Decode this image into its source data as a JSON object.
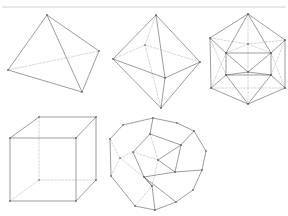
{
  "figure": {
    "background_color": "#ffffff",
    "solid_edge_color": "#5a5a5a",
    "hidden_edge_color": "#b4b4b4",
    "rule_color": "#c9c9c9",
    "canvas": {
      "width": 288,
      "height": 216
    },
    "top_rule": {
      "x1": 2,
      "y1": 7,
      "x2": 286,
      "y2": 7
    }
  },
  "solids": [
    {
      "name": "tetrahedron",
      "label": "Tetrahedron",
      "faces": 4,
      "vertices_count": 4,
      "edges_count": 6,
      "row": 1,
      "column": 1,
      "vertices": [
        [
          47,
          15
        ],
        [
          8,
          70
        ],
        [
          82,
          92
        ],
        [
          99,
          51
        ]
      ],
      "solid_edges": [
        [
          0,
          1
        ],
        [
          0,
          2
        ],
        [
          0,
          3
        ],
        [
          1,
          2
        ],
        [
          2,
          3
        ]
      ],
      "hidden_edges": [
        [
          1,
          3
        ]
      ]
    },
    {
      "name": "octahedron",
      "label": "Octahedron",
      "faces": 8,
      "vertices_count": 6,
      "edges_count": 12,
      "row": 1,
      "column": 2,
      "vertices": [
        [
          156,
          15
        ],
        [
          113,
          59
        ],
        [
          165,
          78
        ],
        [
          200,
          62
        ],
        [
          145,
          45
        ],
        [
          161,
          108
        ]
      ],
      "solid_edges": [
        [
          0,
          1
        ],
        [
          0,
          2
        ],
        [
          0,
          3
        ],
        [
          1,
          2
        ],
        [
          2,
          3
        ],
        [
          1,
          5
        ],
        [
          2,
          5
        ],
        [
          3,
          5
        ]
      ],
      "hidden_edges": [
        [
          0,
          4
        ],
        [
          1,
          4
        ],
        [
          3,
          4
        ],
        [
          4,
          5
        ]
      ]
    },
    {
      "name": "icosahedron",
      "label": "Icosahedron",
      "faces": 20,
      "vertices_count": 12,
      "edges_count": 30,
      "row": 1,
      "column": 3,
      "vertices": [
        [
          248,
          14
        ],
        [
          210,
          38
        ],
        [
          248,
          104
        ],
        [
          211,
          88
        ],
        [
          285,
          88
        ],
        [
          285,
          40
        ],
        [
          226,
          53
        ],
        [
          271,
          53
        ],
        [
          248,
          72
        ],
        [
          226,
          75
        ],
        [
          271,
          75
        ],
        [
          248,
          44
        ]
      ],
      "solid_edges": [
        [
          0,
          1
        ],
        [
          0,
          5
        ],
        [
          1,
          3
        ],
        [
          5,
          4
        ],
        [
          3,
          2
        ],
        [
          4,
          2
        ],
        [
          0,
          6
        ],
        [
          0,
          7
        ],
        [
          1,
          6
        ],
        [
          5,
          7
        ],
        [
          6,
          7
        ],
        [
          6,
          9
        ],
        [
          7,
          10
        ],
        [
          9,
          10
        ],
        [
          6,
          8
        ],
        [
          7,
          8
        ],
        [
          8,
          9
        ],
        [
          8,
          10
        ],
        [
          2,
          9
        ],
        [
          2,
          10
        ],
        [
          3,
          9
        ],
        [
          4,
          10
        ]
      ],
      "hidden_edges": [
        [
          0,
          11
        ],
        [
          1,
          11
        ],
        [
          5,
          11
        ],
        [
          11,
          6
        ],
        [
          11,
          7
        ],
        [
          1,
          9
        ],
        [
          5,
          10
        ],
        [
          3,
          6
        ],
        [
          4,
          7
        ],
        [
          2,
          8
        ],
        [
          11,
          8
        ],
        [
          3,
          4
        ]
      ]
    },
    {
      "name": "cube",
      "label": "Cube",
      "faces": 6,
      "vertices_count": 8,
      "edges_count": 12,
      "row": 2,
      "column": 1,
      "vertices": [
        [
          10,
          138
        ],
        [
          76,
          138
        ],
        [
          76,
          201
        ],
        [
          10,
          201
        ],
        [
          39,
          117
        ],
        [
          96,
          117
        ],
        [
          96,
          180
        ],
        [
          39,
          180
        ]
      ],
      "solid_edges": [
        [
          0,
          1
        ],
        [
          1,
          2
        ],
        [
          2,
          3
        ],
        [
          3,
          0
        ],
        [
          4,
          5
        ],
        [
          5,
          6
        ],
        [
          0,
          4
        ],
        [
          1,
          5
        ],
        [
          2,
          6
        ]
      ],
      "hidden_edges": [
        [
          4,
          7
        ],
        [
          6,
          7
        ],
        [
          3,
          7
        ]
      ]
    },
    {
      "name": "dodecahedron",
      "label": "Dodecahedron",
      "faces": 12,
      "vertices_count": 20,
      "edges_count": 30,
      "row": 2,
      "column": 2,
      "vertices": [
        [
          153,
          118
        ],
        [
          194,
          131
        ],
        [
          202,
          170
        ],
        [
          176,
          202
        ],
        [
          135,
          206
        ],
        [
          111,
          176
        ],
        [
          110,
          139
        ],
        [
          123,
          125
        ],
        [
          177,
          123
        ],
        [
          206,
          151
        ],
        [
          193,
          190
        ],
        [
          155,
          210
        ],
        [
          120,
          158
        ],
        [
          150,
          134
        ],
        [
          181,
          145
        ],
        [
          175,
          172
        ],
        [
          144,
          177
        ],
        [
          133,
          152
        ],
        [
          158,
          160
        ],
        [
          152,
          186
        ]
      ],
      "solid_edges": [
        [
          0,
          8
        ],
        [
          8,
          1
        ],
        [
          1,
          9
        ],
        [
          9,
          2
        ],
        [
          2,
          10
        ],
        [
          10,
          3
        ],
        [
          3,
          11
        ],
        [
          11,
          4
        ],
        [
          4,
          5
        ],
        [
          5,
          6
        ],
        [
          6,
          7
        ],
        [
          7,
          0
        ],
        [
          0,
          13
        ],
        [
          13,
          14
        ],
        [
          14,
          15
        ],
        [
          15,
          16
        ],
        [
          16,
          17
        ],
        [
          13,
          17
        ],
        [
          1,
          14
        ],
        [
          2,
          15
        ],
        [
          3,
          16
        ],
        [
          14,
          18
        ],
        [
          15,
          18
        ],
        [
          16,
          19
        ],
        [
          11,
          19
        ],
        [
          19,
          16
        ]
      ],
      "hidden_edges": [
        [
          6,
          12
        ],
        [
          12,
          17
        ],
        [
          12,
          5
        ],
        [
          17,
          18
        ],
        [
          18,
          19
        ],
        [
          13,
          18
        ],
        [
          12,
          16
        ],
        [
          4,
          19
        ]
      ]
    }
  ]
}
